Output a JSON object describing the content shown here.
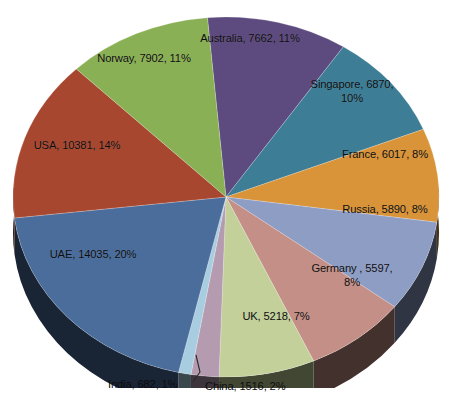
{
  "chart_data": {
    "type": "pie",
    "title": "",
    "subtitle": "",
    "xlabel": "",
    "ylabel": "",
    "legend_position": "none",
    "grid": false,
    "three_d": true,
    "total": 71770,
    "categories": [
      "Australia",
      "Singapore",
      "France",
      "Russia",
      "Germany",
      "UK",
      "China",
      "India",
      "UAE",
      "USA",
      "Norway"
    ],
    "values": [
      7662,
      6870,
      6017,
      5890,
      5597,
      5218,
      1516,
      682,
      14035,
      10381,
      7902
    ],
    "percents": [
      11,
      10,
      8,
      8,
      8,
      7,
      2,
      1,
      20,
      14,
      11
    ],
    "colors": [
      "#5d4a7e",
      "#3d7e96",
      "#d99338",
      "#8e9dc4",
      "#c48f86",
      "#c3d09a",
      "#b49bb0",
      "#a8cde0",
      "#4a6d9c",
      "#a84730",
      "#8ab055"
    ],
    "slices": [
      {
        "name": "Australia",
        "value": 7662,
        "percent": 11,
        "color": "#5d4a7e",
        "label": "Australia, 7662, 11%"
      },
      {
        "name": "Singapore",
        "value": 6870,
        "percent": 10,
        "color": "#3d7e96",
        "label": "Singapore, 6870,\n10%"
      },
      {
        "name": "France",
        "value": 6017,
        "percent": 8,
        "color": "#d99338",
        "label": "France, 6017, 8%"
      },
      {
        "name": "Russia",
        "value": 5890,
        "percent": 8,
        "color": "#8e9dc4",
        "label": "Russia, 5890, 8%"
      },
      {
        "name": "Germany",
        "value": 5597,
        "percent": 8,
        "color": "#c48f86",
        "label": "Germany , 5597,\n8%"
      },
      {
        "name": "UK",
        "value": 5218,
        "percent": 7,
        "color": "#c3d09a",
        "label": "UK, 5218, 7%"
      },
      {
        "name": "China",
        "value": 1516,
        "percent": 2,
        "color": "#b49bb0",
        "label": "China, 1516, 2%"
      },
      {
        "name": "India",
        "value": 682,
        "percent": 1,
        "color": "#a8cde0",
        "label": "India, 682, 1%"
      },
      {
        "name": "UAE",
        "value": 14035,
        "percent": 20,
        "color": "#4a6d9c",
        "label": "UAE, 14035, 20%"
      },
      {
        "name": "USA",
        "value": 10381,
        "percent": 14,
        "color": "#a84730",
        "label": "USA, 10381, 14%"
      },
      {
        "name": "Norway",
        "value": 7902,
        "percent": 11,
        "color": "#8ab055",
        "label": "Norway, 7902, 11%"
      }
    ]
  },
  "labels": {
    "australia": "Australia, 7662, 11%",
    "singapore": "Singapore, 6870,\n10%",
    "france": "France, 6017, 8%",
    "russia": "Russia, 5890, 8%",
    "germany": "Germany , 5597,\n8%",
    "uk": "UK, 5218, 7%",
    "china": "China, 1516, 2%",
    "india": "India, 682, 1%",
    "uae": "UAE, 14035, 20%",
    "usa": "USA, 10381, 14%",
    "norway": "Norway, 7902, 11%"
  }
}
